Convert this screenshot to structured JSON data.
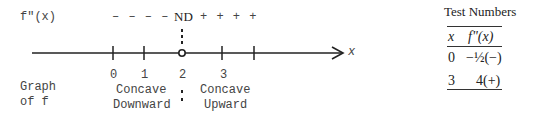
{
  "number_line": {
    "function_label": "f\"(x)",
    "signs_left": "– – – –",
    "nd_label": "ND",
    "signs_right": "+ + + +",
    "axis_label": "x",
    "ticks": [
      "0",
      "1",
      "2",
      "3"
    ]
  },
  "graph_label": {
    "line1": "Graph",
    "line2": "of f"
  },
  "intervals": {
    "left": {
      "line1": "Concave",
      "line2": "Downward"
    },
    "right": {
      "line1": "Concave",
      "line2": "Upward"
    }
  },
  "test_table": {
    "title": "Test Numbers",
    "headers": [
      "x",
      "f\"(x)"
    ],
    "rows": [
      {
        "x": "0",
        "value": "−½(−)"
      },
      {
        "x": "3",
        "value": "4(+)"
      }
    ]
  }
}
